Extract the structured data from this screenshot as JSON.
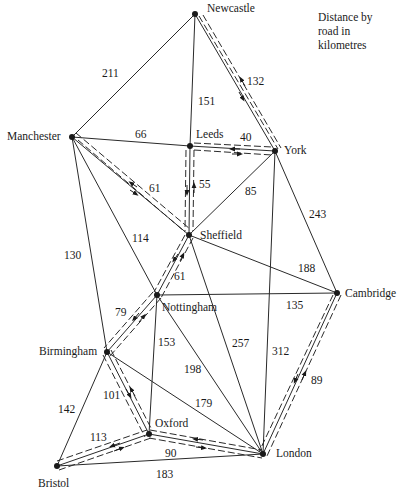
{
  "legend": {
    "line1": "Distance by",
    "line2": "road in",
    "line3": "kilometres"
  },
  "towns": {
    "newcastle": {
      "name": "Newcastle",
      "x": 195,
      "y": 14
    },
    "manchester": {
      "name": "Manchester",
      "x": 72,
      "y": 137
    },
    "leeds": {
      "name": "Leeds",
      "x": 190,
      "y": 146
    },
    "york": {
      "name": "York",
      "x": 275,
      "y": 151
    },
    "sheffield": {
      "name": "Sheffield",
      "x": 189,
      "y": 235
    },
    "nottingham": {
      "name": "Nottingham",
      "x": 157,
      "y": 295
    },
    "cambridge": {
      "name": "Cambridge",
      "x": 337,
      "y": 293
    },
    "birmingham": {
      "name": "Birmingham",
      "x": 107,
      "y": 352
    },
    "oxford": {
      "name": "Oxford",
      "x": 149,
      "y": 434
    },
    "bristol": {
      "name": "Bristol",
      "x": 57,
      "y": 466
    },
    "london": {
      "name": "London",
      "x": 263,
      "y": 454
    }
  },
  "roads": [
    {
      "from": "newcastle",
      "to": "manchester",
      "km": "211",
      "route": false
    },
    {
      "from": "newcastle",
      "to": "leeds",
      "km": "151",
      "route": false
    },
    {
      "from": "newcastle",
      "to": "york",
      "km": "132",
      "route": true
    },
    {
      "from": "manchester",
      "to": "leeds",
      "km": "66",
      "route": false
    },
    {
      "from": "leeds",
      "to": "york",
      "km": "40",
      "route": true
    },
    {
      "from": "manchester",
      "to": "sheffield",
      "km": "61",
      "route": true
    },
    {
      "from": "leeds",
      "to": "sheffield",
      "km": "55",
      "route": true
    },
    {
      "from": "york",
      "to": "sheffield",
      "km": "85",
      "route": false
    },
    {
      "from": "york",
      "to": "cambridge",
      "km": "243",
      "route": false
    },
    {
      "from": "manchester",
      "to": "nottingham",
      "km": "114",
      "route": false
    },
    {
      "from": "manchester",
      "to": "birmingham",
      "km": "130",
      "route": false
    },
    {
      "from": "sheffield",
      "to": "cambridge",
      "km": "188",
      "route": false
    },
    {
      "from": "sheffield",
      "to": "nottingham",
      "km": "61",
      "route": true
    },
    {
      "from": "nottingham",
      "to": "cambridge",
      "km": "135",
      "route": false
    },
    {
      "from": "nottingham",
      "to": "birmingham",
      "km": "79",
      "route": true
    },
    {
      "from": "sheffield",
      "to": "london",
      "km": "257",
      "route": false
    },
    {
      "from": "york",
      "to": "london",
      "km": "312",
      "route": false
    },
    {
      "from": "cambridge",
      "to": "london",
      "km": "89",
      "route": true
    },
    {
      "from": "nottingham",
      "to": "oxford",
      "km": "153",
      "route": false
    },
    {
      "from": "nottingham",
      "to": "london",
      "km": "198",
      "route": false
    },
    {
      "from": "birmingham",
      "to": "london",
      "km": "179",
      "route": false
    },
    {
      "from": "birmingham",
      "to": "oxford",
      "km": "101",
      "route": true
    },
    {
      "from": "birmingham",
      "to": "bristol",
      "km": "142",
      "route": false
    },
    {
      "from": "bristol",
      "to": "oxford",
      "km": "113",
      "route": true
    },
    {
      "from": "oxford",
      "to": "london",
      "km": "90",
      "route": true
    },
    {
      "from": "bristol",
      "to": "london",
      "km": "183",
      "route": false
    }
  ],
  "distance_labels": {
    "d211": "211",
    "d151": "151",
    "d132": "132",
    "d66": "66",
    "d40": "40",
    "d61a": "61",
    "d55": "55",
    "d85": "85",
    "d243": "243",
    "d114": "114",
    "d130": "130",
    "d188": "188",
    "d61b": "61",
    "d135": "135",
    "d79": "79",
    "d257": "257",
    "d312": "312",
    "d89": "89",
    "d153": "153",
    "d198": "198",
    "d179": "179",
    "d101": "101",
    "d142": "142",
    "d113": "113",
    "d90": "90",
    "d183": "183"
  }
}
